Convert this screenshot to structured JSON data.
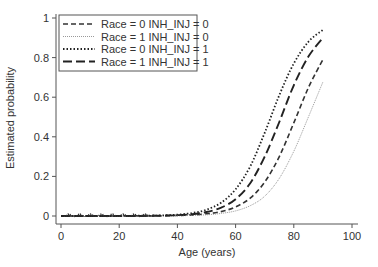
{
  "chart_data": {
    "type": "line",
    "title": "",
    "xlabel": "Age (years)",
    "ylabel": "Estimated probability",
    "xlim": [
      0,
      100
    ],
    "ylim": [
      0,
      1
    ],
    "xticks": [
      0,
      20,
      40,
      60,
      80,
      100
    ],
    "yticks": [
      0,
      0.2,
      0.4,
      0.6,
      0.8,
      1
    ],
    "ytick_labels": [
      "0",
      "0.2",
      "0.4",
      "0.6",
      "0.8",
      "1"
    ],
    "grid": false,
    "legend_position": "upper left",
    "x": [
      0,
      5,
      10,
      15,
      20,
      25,
      30,
      35,
      40,
      45,
      50,
      55,
      60,
      65,
      70,
      75,
      80,
      85,
      90
    ],
    "series": [
      {
        "name": "Race = 0 INH_INJ = 0",
        "style": "dashed",
        "color": "#333333",
        "values": [
          0.0,
          0.0,
          0.0,
          0.0,
          0.0,
          0.001,
          0.001,
          0.001,
          0.003,
          0.005,
          0.011,
          0.022,
          0.046,
          0.09,
          0.171,
          0.3,
          0.47,
          0.648,
          0.79
        ]
      },
      {
        "name": "Race = 1 INH_INJ = 0",
        "style": "fine-dotted",
        "color": "#999999",
        "values": [
          0.0,
          0.0,
          0.0,
          0.0,
          0.0,
          0.0,
          0.0,
          0.001,
          0.001,
          0.003,
          0.006,
          0.013,
          0.026,
          0.052,
          0.1,
          0.19,
          0.327,
          0.5,
          0.677
        ]
      },
      {
        "name": "Race = 0 INH_INJ = 1",
        "style": "dotted",
        "color": "#222222",
        "values": [
          0.0,
          0.0,
          0.0,
          0.0,
          0.0,
          0.001,
          0.002,
          0.003,
          0.007,
          0.015,
          0.032,
          0.067,
          0.135,
          0.25,
          0.42,
          0.61,
          0.77,
          0.88,
          0.94
        ]
      },
      {
        "name": "Race = 1 INH_INJ = 1",
        "style": "long-dashed",
        "color": "#222222",
        "values": [
          0.0,
          0.0,
          0.0,
          0.0,
          0.0,
          0.0,
          0.001,
          0.002,
          0.004,
          0.009,
          0.02,
          0.042,
          0.085,
          0.165,
          0.3,
          0.475,
          0.66,
          0.805,
          0.9
        ]
      }
    ]
  }
}
